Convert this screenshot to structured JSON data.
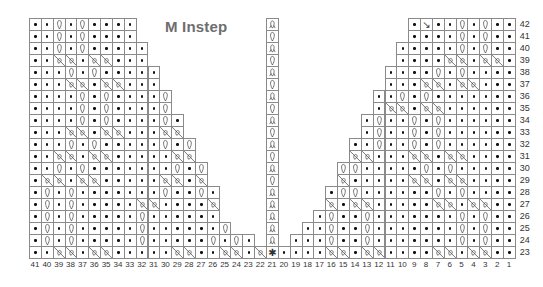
{
  "title": "M Instep",
  "chart_data": {
    "type": "table",
    "title": "M Instep",
    "legend_symbols": {
      ".": "purl (dot)",
      "Q": "twisted stitch (loop)",
      "A": "twisted stitch variant (double loop)",
      "*": "center increase (asterisk)",
      "N": "decrease",
      "X": "cable cross",
      " ": "no stitch"
    },
    "columns": [
      41,
      40,
      39,
      38,
      37,
      36,
      35,
      34,
      33,
      32,
      31,
      30,
      29,
      28,
      27,
      26,
      25,
      24,
      23,
      22,
      21,
      20,
      19,
      18,
      17,
      16,
      15,
      14,
      13,
      12,
      11,
      10,
      9,
      8,
      7,
      6,
      5,
      4,
      3,
      2,
      1
    ],
    "rows": [
      {
        "row": 42,
        "cells": "..Q.Q....           A            N..Q.Q.."
      },
      {
        "row": 41,
        "cells": "..Q.Q....           Q            ...Q.Q.."
      },
      {
        "row": 40,
        "cells": "..Q.Q.....          A           ....Q.Q.."
      },
      {
        "row": 39,
        "cells": "..XX.XX...          Q           ...XX.XX."
      },
      {
        "row": 38,
        "cells": "...Q.Q.....         A          ....Q.Q...."
      },
      {
        "row": 37,
        "cells": "...XX.XX...         Q          ...XX.XX..."
      },
      {
        "row": 36,
        "cells": "....Q.Q....Q        A         ...Q.Q......."
      },
      {
        "row": 35,
        "cells": "....Q.Q....Q        Q         ..XX.XX......"
      },
      {
        "row": 34,
        "cells": "....Q.Q....Q.       A        .Q..Q.Q......"
      },
      {
        "row": 33,
        "cells": "...XX.XX...XX       Q        .Q..Q.Q......"
      },
      {
        "row": 32,
        "cells": "...Q.Q.....Q.Q      A       ..Q..Q.Q......"
      },
      {
        "row": 31,
        "cells": "..XX.XX.....XX      Q       .XX...XX.XX...."
      },
      {
        "row": 30,
        "cells": "..Q.Q.......Q.Q     A      .QQ.....Q.Q....."
      },
      {
        "row": 29,
        "cells": ".XX.XX.....XX.X     Q      .XX.....XX.XX...."
      },
      {
        "row": 28,
        "cells": ".Q.Q.......Q..Q.    A     ..QQ......Q.Q...."
      },
      {
        "row": 27,
        "cells": ".Q.Q.....XX....XX   A     .XX.XX.....XX.XX.."
      },
      {
        "row": 26,
        "cells": ".Q.Q.....Q......Q.  A    .Q..Q.......Q.Q.."
      },
      {
        "row": 25,
        "cells": ".Q.Q.....Q......Q.Q A   ..Q..Q.......Q.Q.."
      },
      {
        "row": 24,
        "cells": ".Q.Q.....Q.....Q.Q.QA  ...Q..Q.......Q.Q.."
      },
      {
        "row": 23,
        "cells": "..XX.XX.....XX..XX.XX*Q.....XX.XX....XX.XX.."
      }
    ],
    "row_labels": [
      42,
      41,
      40,
      39,
      38,
      37,
      36,
      35,
      34,
      33,
      32,
      31,
      30,
      29,
      28,
      27,
      26,
      25,
      24,
      23
    ],
    "column_labels": [
      41,
      40,
      39,
      38,
      37,
      36,
      35,
      34,
      33,
      32,
      31,
      30,
      29,
      28,
      27,
      26,
      25,
      24,
      23,
      22,
      21,
      20,
      19,
      18,
      17,
      16,
      15,
      14,
      13,
      12,
      11,
      10,
      9,
      8,
      7,
      6,
      5,
      4,
      3,
      2,
      1
    ],
    "left_panel_extent": {
      "42": [
        41,
        33
      ],
      "41": [
        41,
        33
      ],
      "40": [
        41,
        32
      ],
      "39": [
        41,
        32
      ],
      "38": [
        41,
        31
      ],
      "37": [
        41,
        31
      ],
      "36": [
        41,
        30
      ],
      "35": [
        41,
        30
      ],
      "34": [
        41,
        29
      ],
      "33": [
        41,
        29
      ],
      "32": [
        41,
        28
      ],
      "31": [
        41,
        28
      ],
      "30": [
        41,
        27
      ],
      "29": [
        41,
        27
      ],
      "28": [
        41,
        26
      ],
      "27": [
        41,
        26
      ],
      "26": [
        41,
        26
      ],
      "25": [
        41,
        25
      ],
      "24": [
        41,
        23
      ],
      "23": [
        41,
        22
      ]
    },
    "right_panel_extent": {
      "42": [
        9,
        1
      ],
      "41": [
        9,
        1
      ],
      "40": [
        10,
        1
      ],
      "39": [
        10,
        1
      ],
      "38": [
        11,
        1
      ],
      "37": [
        11,
        1
      ],
      "36": [
        12,
        1
      ],
      "35": [
        12,
        1
      ],
      "34": [
        13,
        1
      ],
      "33": [
        13,
        1
      ],
      "32": [
        14,
        1
      ],
      "31": [
        14,
        1
      ],
      "30": [
        15,
        1
      ],
      "29": [
        15,
        1
      ],
      "28": [
        16,
        1
      ],
      "27": [
        16,
        1
      ],
      "26": [
        17,
        1
      ],
      "25": [
        18,
        1
      ],
      "24": [
        19,
        1
      ],
      "23": [
        20,
        1
      ]
    },
    "center_column": {
      "column": 21,
      "rows": {
        "42": "A",
        "41": "Q",
        "40": "A",
        "39": "Q",
        "38": "A",
        "37": "Q",
        "36": "A",
        "35": "Q",
        "34": "A",
        "33": "Q",
        "32": "A",
        "31": "Q",
        "30": "A",
        "29": "Q",
        "28": "A",
        "27": "A",
        "26": "A",
        "25": "A",
        "24": "A",
        "23": "*"
      }
    }
  },
  "layout": {
    "grid_left": 29,
    "grid_top": 18,
    "cell_w": 11.85,
    "cell_h": 12,
    "line_color": "#8a8a8a",
    "title_color": "#6d6e70"
  }
}
